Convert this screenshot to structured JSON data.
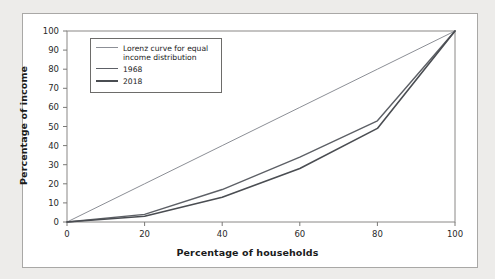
{
  "chart_data": {
    "type": "line",
    "title": "",
    "xlabel": "Percentage of households",
    "ylabel": "Percentage of income",
    "xlim": [
      0,
      100
    ],
    "ylim": [
      0,
      100
    ],
    "xticks": [
      0,
      20,
      40,
      60,
      80,
      100
    ],
    "yticks": [
      0,
      10,
      20,
      30,
      40,
      50,
      60,
      70,
      80,
      90,
      100
    ],
    "grid": false,
    "legend_position": "upper-left-inside",
    "x": [
      0,
      20,
      40,
      60,
      80,
      100
    ],
    "series": [
      {
        "name": "Lorenz curve for equal\nincome distribution",
        "label_lines": [
          "Lorenz curve for equal",
          "income distribution"
        ],
        "values": [
          0,
          20,
          40,
          60,
          80,
          100
        ],
        "color": "#8c8f96",
        "width": 1.0
      },
      {
        "name": "1968",
        "label_lines": [
          "1968"
        ],
        "values": [
          0,
          4,
          17,
          34,
          53,
          100
        ],
        "color": "#5d6066",
        "width": 1.4
      },
      {
        "name": "2018",
        "label_lines": [
          "2018"
        ],
        "values": [
          0,
          3,
          13,
          28,
          49,
          100
        ],
        "color": "#4a4d52",
        "width": 1.6
      }
    ]
  },
  "colors": {
    "page_background": "#edecea",
    "panel_background": "#ffffff",
    "panel_border": "#a9a8a6",
    "axis": "#7a7977",
    "text": "#1b1b1b"
  }
}
